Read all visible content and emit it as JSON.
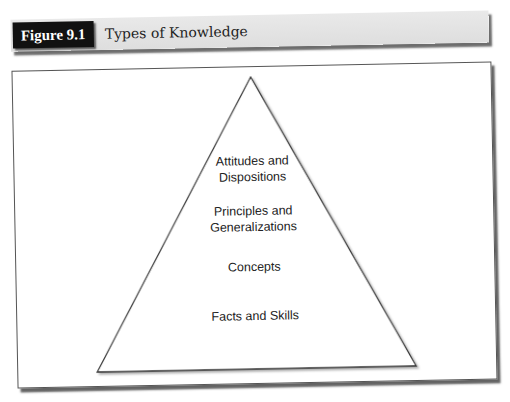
{
  "figure": {
    "label": "Figure 9.1",
    "title": "Types of Knowledge"
  },
  "pyramid": {
    "levels": [
      {
        "line1": "Attitudes and",
        "line2": "Dispositions"
      },
      {
        "line1": "Principles and",
        "line2": "Generalizations"
      },
      {
        "line1": "Concepts",
        "line2": ""
      },
      {
        "line1": "Facts and Skills",
        "line2": ""
      }
    ]
  }
}
